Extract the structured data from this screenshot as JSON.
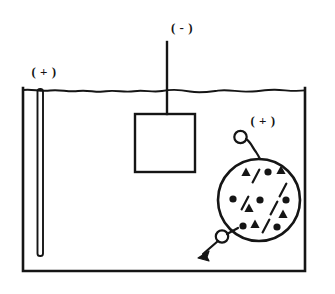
{
  "figure": {
    "background_color": "#ffffff",
    "ink_color": "#151515",
    "labels": {
      "anode_label": "( + )",
      "cathode_label": "( - )",
      "particle_label": "( + )"
    },
    "tank": {
      "name": "electrolyte-tank",
      "x": 23,
      "y": 88,
      "width": 282,
      "height": 184
    },
    "water_line": {
      "name": "electrolyte-surface",
      "y": 90,
      "x_start": 23,
      "x_end": 305,
      "style": "wavy"
    },
    "anode_rod": {
      "name": "anode-electrode-rod",
      "x": 40,
      "y_top": 90,
      "y_bottom": 255,
      "width": 6
    },
    "cathode": {
      "name": "cathode-plate",
      "lead_x": 167,
      "lead_y_top": 42,
      "plate_x": 135,
      "plate_y": 114,
      "plate_width": 60,
      "plate_height": 58
    },
    "particle": {
      "name": "charged-particle",
      "center_x": 259,
      "center_y": 200,
      "radius": 41,
      "bubble_top": {
        "cx": 241,
        "cy": 137,
        "r": 6
      },
      "bubble_bottom": {
        "cx": 222,
        "cy": 237,
        "r": 6
      },
      "arrow": {
        "x1": 218,
        "y1": 241,
        "x2": 200,
        "y2": 257
      },
      "contents": [
        {
          "type": "triangle",
          "x": 246,
          "y": 172
        },
        {
          "type": "slash",
          "x": 256,
          "y": 176
        },
        {
          "type": "dot",
          "x": 268,
          "y": 172
        },
        {
          "type": "triangle",
          "x": 281,
          "y": 170
        },
        {
          "type": "slash",
          "x": 283,
          "y": 190
        },
        {
          "type": "dot",
          "x": 233,
          "y": 199
        },
        {
          "type": "slash",
          "x": 245,
          "y": 203
        },
        {
          "type": "triangle",
          "x": 249,
          "y": 208
        },
        {
          "type": "dot",
          "x": 260,
          "y": 200
        },
        {
          "type": "slash",
          "x": 274,
          "y": 208
        },
        {
          "type": "dot",
          "x": 286,
          "y": 200
        },
        {
          "type": "triangle",
          "x": 283,
          "y": 214
        },
        {
          "type": "dot",
          "x": 243,
          "y": 226
        },
        {
          "type": "triangle",
          "x": 255,
          "y": 224
        },
        {
          "type": "slash",
          "x": 266,
          "y": 226
        },
        {
          "type": "dot",
          "x": 277,
          "y": 227
        }
      ]
    }
  }
}
